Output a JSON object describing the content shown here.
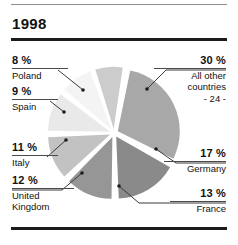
{
  "figure": {
    "title": "1998",
    "has_top_rule": true,
    "has_title_rule": true,
    "has_bottom_rule": true,
    "background_color": "#ffffff",
    "text_color": "#111111",
    "rule_color": "#1c1c1c"
  },
  "labels": {
    "poland": {
      "pct": "8 %",
      "name": "Poland"
    },
    "spain": {
      "pct": "9 %",
      "name": "Spain"
    },
    "italy": {
      "pct": "11 %",
      "name": "Italy"
    },
    "uk": {
      "pct": "12 %",
      "name": "United\nKingdom"
    },
    "other": {
      "pct": "30 %",
      "name": "All other\ncountries\n- 24 -"
    },
    "germany": {
      "pct": "17 %",
      "name": "Germany"
    },
    "france": {
      "pct": "13 %",
      "name": "France"
    }
  },
  "chart_data": {
    "type": "pie",
    "title": "1998",
    "xlabel": "",
    "ylabel": "",
    "legend_position": "callout-labels",
    "grid": false,
    "exploded": true,
    "start_angle_deg": -80,
    "direction": "clockwise",
    "center": {
      "x": 113,
      "y": 133
    },
    "radius": 62,
    "categories": [
      "All other countries - 24 -",
      "Germany",
      "France",
      "United Kingdom",
      "Italy",
      "Spain",
      "Poland"
    ],
    "values": [
      30,
      17,
      13,
      12,
      11,
      9,
      8
    ],
    "unit": "%",
    "colors": [
      "#a8a8a8",
      "#8a8a8a",
      "#969696",
      "#c2c2c2",
      "#e9e9e9",
      "#f4f4f4",
      "#cccccc"
    ],
    "slice_gap_color": "#ffffff",
    "annotations": [
      "8 % Poland",
      "9 % Spain",
      "11 % Italy",
      "12 % United Kingdom",
      "13 % France",
      "17 % Germany",
      "30 % All other countries - 24 -"
    ]
  }
}
